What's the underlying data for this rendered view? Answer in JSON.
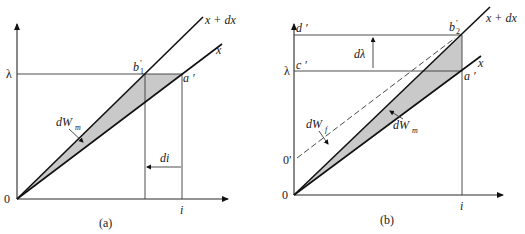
{
  "figure": {
    "panels": [
      {
        "id": "a",
        "caption": "(a)",
        "labels": {
          "origin": "0",
          "y_value": "λ",
          "x_value": "i",
          "curve_x_plus_dx": "x + dx",
          "curve_x": "x",
          "point_b": "b",
          "point_b_sub": "1",
          "point_b_prime": "′",
          "point_a": "a ′",
          "energy_label": "dW",
          "energy_sub": "m",
          "delta_label": "di"
        }
      },
      {
        "id": "b",
        "caption": "(b)",
        "labels": {
          "origin": "0",
          "origin_prime": "0′",
          "y_value": "λ",
          "x_value": "i",
          "curve_x_plus_dx": "x + dx",
          "curve_x": "x",
          "point_b": "b",
          "point_b_sub": "2",
          "point_b_prime": "′",
          "point_a": "a ′",
          "point_c": "c ′",
          "point_d": "d ′",
          "energy_f_label": "dW",
          "energy_f_sub": "f",
          "energy_m_label": "dW",
          "energy_m_sub": "m",
          "delta_label": "dλ"
        }
      }
    ],
    "colors": {
      "shade": "#c9c9c9",
      "line": "#111111",
      "background": "#ffffff"
    }
  }
}
